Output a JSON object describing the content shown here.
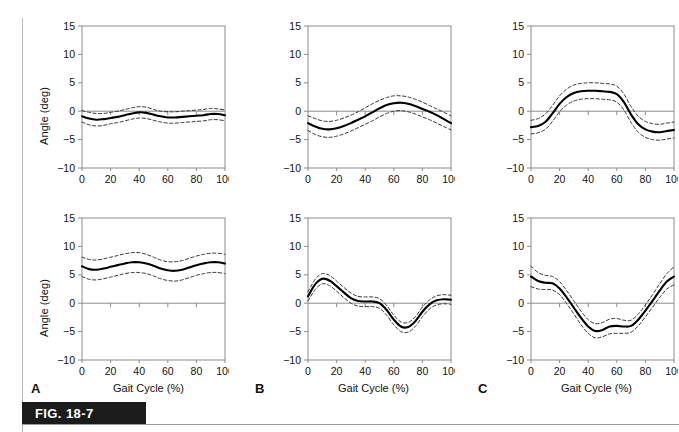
{
  "figure": {
    "label": "FIG. 18-7",
    "y_axis_label": "Angle (deg)",
    "x_axis_label": "Gait Cycle (%)",
    "panel_letters": [
      "A",
      "B",
      "C"
    ],
    "accent_color": "#1b1b1b",
    "mean_line_color": "#000000",
    "band_line_color": "#333333",
    "frame_color": "#8c8c8c",
    "zero_line_color": "#8c8c8c"
  },
  "axes": {
    "x_ticks": [
      0,
      20,
      40,
      60,
      80,
      100
    ],
    "y_ticks": [
      15,
      10,
      5,
      0,
      -5,
      -10
    ],
    "x_tick_labels": [
      "0",
      "20",
      "40",
      "60",
      "80",
      "100"
    ],
    "y_tick_labels": [
      "15",
      "10",
      "5",
      "0",
      "-5",
      "-10"
    ],
    "xlim": [
      0,
      100
    ],
    "ylim": [
      -10,
      15
    ]
  },
  "chart_data": [
    {
      "id": "panel-A-top",
      "type": "line",
      "panel": "A",
      "row": "top",
      "title": "",
      "xlabel": "Gait Cycle (%)",
      "ylabel": "Angle (deg)",
      "xlim": [
        0,
        100
      ],
      "ylim": [
        -10,
        15
      ],
      "grid": false,
      "legend": "none",
      "x": [
        0,
        5,
        10,
        15,
        20,
        25,
        30,
        35,
        40,
        45,
        50,
        55,
        60,
        65,
        70,
        75,
        80,
        85,
        90,
        95,
        100
      ],
      "series": [
        {
          "name": "mean",
          "style": "solid",
          "values": [
            -0.9,
            -1.3,
            -1.5,
            -1.4,
            -1.2,
            -1.0,
            -0.7,
            -0.4,
            -0.2,
            -0.3,
            -0.6,
            -0.9,
            -1.1,
            -1.1,
            -1.0,
            -0.9,
            -0.8,
            -0.7,
            -0.5,
            -0.5,
            -0.7
          ]
        },
        {
          "name": "upper_sd",
          "style": "dashed",
          "values": [
            0.1,
            -0.2,
            -0.4,
            -0.4,
            -0.2,
            0.0,
            0.3,
            0.6,
            0.8,
            0.7,
            0.3,
            0.0,
            -0.1,
            -0.1,
            0.0,
            0.1,
            0.2,
            0.3,
            0.5,
            0.4,
            0.2
          ]
        },
        {
          "name": "lower_sd",
          "style": "dashed",
          "values": [
            -1.9,
            -2.4,
            -2.6,
            -2.5,
            -2.2,
            -2.0,
            -1.7,
            -1.4,
            -1.2,
            -1.3,
            -1.6,
            -1.9,
            -2.1,
            -2.1,
            -2.0,
            -1.9,
            -1.8,
            -1.7,
            -1.5,
            -1.5,
            -1.7
          ]
        }
      ]
    },
    {
      "id": "panel-B-top",
      "type": "line",
      "panel": "B",
      "row": "top",
      "title": "",
      "xlabel": "Gait Cycle (%)",
      "ylabel": "Angle (deg)",
      "xlim": [
        0,
        100
      ],
      "ylim": [
        -10,
        15
      ],
      "grid": false,
      "legend": "none",
      "x": [
        0,
        5,
        10,
        15,
        20,
        25,
        30,
        35,
        40,
        45,
        50,
        55,
        60,
        65,
        70,
        75,
        80,
        85,
        90,
        95,
        100
      ],
      "series": [
        {
          "name": "mean",
          "style": "solid",
          "values": [
            -2.1,
            -2.7,
            -3.1,
            -3.2,
            -3.0,
            -2.6,
            -2.1,
            -1.5,
            -0.9,
            -0.2,
            0.5,
            1.1,
            1.4,
            1.5,
            1.3,
            0.9,
            0.4,
            -0.1,
            -0.7,
            -1.4,
            -2.1
          ]
        },
        {
          "name": "upper_sd",
          "style": "dashed",
          "values": [
            -0.8,
            -1.3,
            -1.7,
            -1.8,
            -1.6,
            -1.2,
            -0.7,
            -0.1,
            0.6,
            1.3,
            1.9,
            2.4,
            2.7,
            2.7,
            2.5,
            2.1,
            1.6,
            1.0,
            0.4,
            -0.2,
            -0.8
          ]
        },
        {
          "name": "lower_sd",
          "style": "dashed",
          "values": [
            -3.4,
            -4.1,
            -4.5,
            -4.6,
            -4.4,
            -4.0,
            -3.5,
            -2.9,
            -2.3,
            -1.7,
            -1.0,
            -0.4,
            0.0,
            0.1,
            -0.1,
            -0.5,
            -1.0,
            -1.5,
            -2.1,
            -2.7,
            -3.3
          ]
        }
      ]
    },
    {
      "id": "panel-C-top",
      "type": "line",
      "panel": "C",
      "row": "top",
      "title": "",
      "xlabel": "Gait Cycle (%)",
      "ylabel": "Angle (deg)",
      "xlim": [
        0,
        100
      ],
      "ylim": [
        -10,
        15
      ],
      "grid": false,
      "legend": "none",
      "x": [
        0,
        5,
        10,
        15,
        20,
        25,
        30,
        35,
        40,
        45,
        50,
        55,
        60,
        65,
        70,
        75,
        80,
        85,
        90,
        95,
        100
      ],
      "series": [
        {
          "name": "mean",
          "style": "solid",
          "values": [
            -2.8,
            -2.6,
            -1.9,
            -0.4,
            1.3,
            2.5,
            3.2,
            3.5,
            3.6,
            3.6,
            3.5,
            3.4,
            3.0,
            1.6,
            -0.6,
            -2.3,
            -3.2,
            -3.6,
            -3.7,
            -3.5,
            -3.3
          ]
        },
        {
          "name": "upper_sd",
          "style": "dashed",
          "values": [
            -1.6,
            -1.3,
            -0.5,
            1.0,
            2.7,
            3.9,
            4.6,
            4.9,
            5.0,
            5.0,
            4.9,
            4.8,
            4.4,
            3.0,
            0.8,
            -0.9,
            -1.8,
            -2.2,
            -2.3,
            -2.1,
            -1.9
          ]
        },
        {
          "name": "lower_sd",
          "style": "dashed",
          "values": [
            -4.0,
            -3.8,
            -3.2,
            -1.8,
            -0.1,
            1.1,
            1.8,
            2.1,
            2.2,
            2.2,
            2.1,
            2.0,
            1.6,
            0.2,
            -2.0,
            -3.7,
            -4.6,
            -5.0,
            -5.1,
            -4.9,
            -4.7
          ]
        }
      ]
    },
    {
      "id": "panel-A-bottom",
      "type": "line",
      "panel": "A",
      "row": "bottom",
      "title": "",
      "xlabel": "Gait Cycle (%)",
      "ylabel": "Angle (deg)",
      "xlim": [
        0,
        100
      ],
      "ylim": [
        -10,
        15
      ],
      "grid": false,
      "legend": "none",
      "x": [
        0,
        5,
        10,
        15,
        20,
        25,
        30,
        35,
        40,
        45,
        50,
        55,
        60,
        65,
        70,
        75,
        80,
        85,
        90,
        95,
        100
      ],
      "series": [
        {
          "name": "mean",
          "style": "solid",
          "values": [
            6.5,
            6.0,
            5.9,
            6.1,
            6.4,
            6.7,
            7.0,
            7.2,
            7.2,
            7.0,
            6.6,
            6.1,
            5.8,
            5.7,
            5.9,
            6.3,
            6.7,
            7.0,
            7.2,
            7.2,
            7.0
          ]
        },
        {
          "name": "upper_sd",
          "style": "dashed",
          "values": [
            8.1,
            7.7,
            7.6,
            7.8,
            8.1,
            8.4,
            8.7,
            8.9,
            8.9,
            8.6,
            8.1,
            7.6,
            7.3,
            7.3,
            7.5,
            7.9,
            8.3,
            8.6,
            8.8,
            8.8,
            8.6
          ]
        },
        {
          "name": "lower_sd",
          "style": "dashed",
          "values": [
            4.7,
            4.2,
            4.1,
            4.3,
            4.6,
            4.9,
            5.2,
            5.4,
            5.4,
            5.2,
            4.8,
            4.3,
            4.0,
            3.9,
            4.1,
            4.5,
            4.9,
            5.2,
            5.4,
            5.4,
            5.2
          ]
        }
      ]
    },
    {
      "id": "panel-B-bottom",
      "type": "line",
      "panel": "B",
      "row": "bottom",
      "title": "",
      "xlabel": "Gait Cycle (%)",
      "ylabel": "Angle (deg)",
      "xlim": [
        0,
        100
      ],
      "ylim": [
        -10,
        15
      ],
      "grid": false,
      "legend": "none",
      "x": [
        0,
        5,
        10,
        15,
        20,
        25,
        30,
        35,
        40,
        45,
        50,
        55,
        60,
        65,
        70,
        75,
        80,
        85,
        90,
        95,
        100
      ],
      "series": [
        {
          "name": "mean",
          "style": "solid",
          "values": [
            1.2,
            3.3,
            4.3,
            4.0,
            3.0,
            1.9,
            0.9,
            0.4,
            0.3,
            0.3,
            0.0,
            -1.2,
            -2.9,
            -4.1,
            -4.2,
            -3.2,
            -1.5,
            -0.2,
            0.5,
            0.7,
            0.6
          ]
        },
        {
          "name": "upper_sd",
          "style": "dashed",
          "values": [
            2.0,
            4.2,
            5.2,
            4.9,
            3.9,
            2.8,
            1.8,
            1.2,
            1.1,
            1.1,
            0.8,
            -0.4,
            -2.1,
            -3.3,
            -3.4,
            -2.4,
            -0.7,
            0.6,
            1.3,
            1.5,
            1.4
          ]
        },
        {
          "name": "lower_sd",
          "style": "dashed",
          "values": [
            0.4,
            2.4,
            3.4,
            3.1,
            2.1,
            1.0,
            0.0,
            -0.5,
            -0.6,
            -0.6,
            -0.9,
            -2.1,
            -3.8,
            -5.0,
            -5.1,
            -4.1,
            -2.4,
            -1.0,
            -0.3,
            -0.1,
            -0.2
          ]
        }
      ]
    },
    {
      "id": "panel-C-bottom",
      "type": "line",
      "panel": "C",
      "row": "bottom",
      "title": "",
      "xlabel": "Gait Cycle (%)",
      "ylabel": "Angle (deg)",
      "xlim": [
        0,
        100
      ],
      "ylim": [
        -10,
        15
      ],
      "grid": false,
      "legend": "none",
      "x": [
        0,
        5,
        10,
        15,
        20,
        25,
        30,
        35,
        40,
        45,
        50,
        55,
        60,
        65,
        70,
        75,
        80,
        85,
        90,
        95,
        100
      ],
      "series": [
        {
          "name": "mean",
          "style": "solid",
          "values": [
            4.7,
            3.9,
            3.6,
            3.5,
            2.6,
            1.0,
            -0.8,
            -2.6,
            -4.1,
            -4.9,
            -4.7,
            -4.1,
            -4.0,
            -4.1,
            -4.0,
            -2.9,
            -1.3,
            0.4,
            2.2,
            3.8,
            4.7
          ]
        },
        {
          "name": "upper_sd",
          "style": "dashed",
          "values": [
            6.5,
            5.4,
            4.9,
            4.7,
            3.8,
            2.2,
            0.4,
            -1.4,
            -2.9,
            -3.6,
            -3.4,
            -2.8,
            -2.7,
            -3.0,
            -3.0,
            -1.9,
            -0.3,
            1.5,
            3.4,
            5.2,
            6.4
          ]
        },
        {
          "name": "lower_sd",
          "style": "dashed",
          "values": [
            2.9,
            2.5,
            2.4,
            2.3,
            1.5,
            -0.1,
            -1.9,
            -3.8,
            -5.3,
            -6.1,
            -5.9,
            -5.4,
            -5.3,
            -5.3,
            -5.1,
            -4.0,
            -2.4,
            -0.7,
            1.0,
            2.5,
            3.2
          ]
        }
      ]
    }
  ]
}
